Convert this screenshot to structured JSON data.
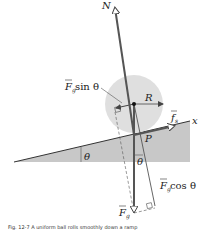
{
  "diagram": {
    "labels": {
      "normal": "N",
      "radius": "R",
      "x_axis": "x",
      "friction_f": "f",
      "friction_sub": "s",
      "contact_point": "P",
      "theta_incline": "θ",
      "theta_vertical": "θ",
      "fg_sin_F": "F",
      "fg_sin_sub": "g",
      "fg_sin_rest": " sin θ",
      "fg_cos_F": "F",
      "fg_cos_sub": "g",
      "fg_cos_rest": " cos  θ",
      "fg_F": "F",
      "fg_sub": "g"
    },
    "caption": "Fig. 12-7  A uniform ball rolls smoothly down a ramp"
  },
  "colors": {
    "ramp": "#c8c8c8",
    "ball": "#dcdcdc",
    "vector": "#555555",
    "line": "#333333"
  }
}
